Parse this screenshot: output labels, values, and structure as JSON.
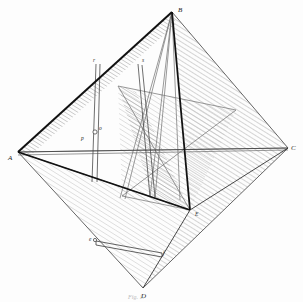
{
  "figure": {
    "caption": "Fig. 1.",
    "background_color": "#fdfdfd",
    "ink_color": "#1a1a1a",
    "hatch_color": "#9a9a9a",
    "light_line_color": "#7d7d7d"
  },
  "vertices": [
    {
      "id": "A",
      "label": "A",
      "x": 18,
      "y": 152,
      "label_x": 10,
      "label_y": 158
    },
    {
      "id": "B",
      "label": "B",
      "x": 172,
      "y": 12,
      "label_x": 179,
      "label_y": 11
    },
    {
      "id": "C",
      "label": "C",
      "x": 288,
      "y": 148,
      "label_x": 292,
      "label_y": 148
    },
    {
      "id": "D",
      "label": "D",
      "x": 143,
      "y": 288,
      "label_x": 143,
      "label_y": 296
    },
    {
      "id": "E",
      "label": "E",
      "x": 190,
      "y": 210,
      "label_x": 196,
      "label_y": 214
    }
  ],
  "interior_points": [
    {
      "id": "p",
      "label": "p",
      "x": 90,
      "y": 136,
      "label_x": 84,
      "label_y": 138
    },
    {
      "id": "o",
      "label": "o",
      "x": 98,
      "y": 129,
      "label_x": 99,
      "label_y": 128
    },
    {
      "id": "r",
      "label": "r",
      "x": 98,
      "y": 64,
      "label_x": 96,
      "label_y": 63
    },
    {
      "id": "s",
      "label": "s",
      "x": 140,
      "y": 64,
      "label_x": 141,
      "label_y": 63
    },
    {
      "id": "e",
      "label": "e",
      "x": 96,
      "y": 242,
      "label_x": 92,
      "label_y": 241
    },
    {
      "id": "f",
      "label": "f",
      "x": 160,
      "y": 256,
      "label_x": 162,
      "label_y": 257
    }
  ],
  "edges": [
    {
      "name": "edge-A-B",
      "from": "A",
      "to": "B",
      "weight": "heavy"
    },
    {
      "name": "edge-B-C",
      "from": "B",
      "to": "C",
      "weight": "light"
    },
    {
      "name": "edge-A-C",
      "from": "A",
      "to": "C",
      "weight": "light"
    },
    {
      "name": "edge-A-D",
      "from": "A",
      "to": "D",
      "weight": "light"
    },
    {
      "name": "edge-C-D",
      "from": "C",
      "to": "D",
      "weight": "light"
    },
    {
      "name": "edge-A-E",
      "from": "A",
      "to": "E",
      "weight": "heavy"
    },
    {
      "name": "edge-B-E",
      "from": "B",
      "to": "E",
      "weight": "heavy"
    },
    {
      "name": "edge-C-E",
      "from": "C",
      "to": "E",
      "weight": "light"
    },
    {
      "name": "edge-D-E",
      "from": "D",
      "to": "E",
      "weight": "light"
    }
  ],
  "construction_lines": [
    {
      "name": "post-r",
      "from_x": 98,
      "from_y": 64,
      "to_x": 94,
      "to_y": 180
    },
    {
      "name": "post-s",
      "from_x": 140,
      "from_y": 64,
      "to_x": 152,
      "to_y": 196
    },
    {
      "name": "chord-A-C-axis",
      "from_x": 18,
      "from_y": 152,
      "to_x": 288,
      "to_y": 148
    },
    {
      "name": "chord-e-f",
      "from_x": 96,
      "from_y": 242,
      "to_x": 162,
      "to_y": 254
    },
    {
      "name": "ray-B-left",
      "from_x": 172,
      "from_y": 12,
      "to_x": 122,
      "to_y": 200
    },
    {
      "name": "ray-B-mid",
      "from_x": 172,
      "from_y": 12,
      "to_x": 150,
      "to_y": 198
    },
    {
      "name": "ray-B-right",
      "from_x": 172,
      "from_y": 12,
      "to_x": 178,
      "to_y": 196
    },
    {
      "name": "plane-edge",
      "from_x": 118,
      "from_y": 86,
      "to_x": 236,
      "to_y": 110
    }
  ],
  "faces": [
    {
      "name": "face-A-B-E",
      "hatched": true
    },
    {
      "name": "face-B-C-E",
      "hatched": true
    },
    {
      "name": "face-A-D-E",
      "hatched": true
    },
    {
      "name": "face-C-D-E",
      "hatched": true
    },
    {
      "name": "face-cut-plane",
      "hatched": true
    }
  ]
}
